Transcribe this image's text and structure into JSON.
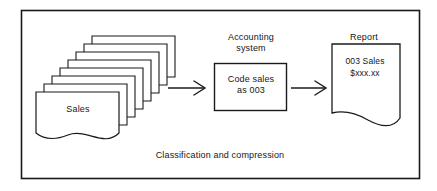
{
  "diagram": {
    "title": "Classification and compression",
    "caption": "Classification and compression",
    "border_color": "#1a1a1a",
    "line_color": "#1a1a1a",
    "background_color": "#ffffff",
    "input": {
      "name": "sales-document-stack",
      "label": "Sales",
      "sheet_count": 8
    },
    "process": {
      "name": "accounting-system",
      "heading_line_1": "Accounting",
      "heading_line_2": "system",
      "body_line_1": "Code sales",
      "body_line_2": "as 003"
    },
    "output": {
      "name": "report-document",
      "heading": "Report",
      "body_line_1": "003 Sales",
      "body_line_2": "$xxx.xx"
    },
    "arrows": [
      {
        "name": "arrow-sales-to-accounting",
        "from": "sales-document-stack",
        "to": "accounting-system"
      },
      {
        "name": "arrow-accounting-to-report",
        "from": "accounting-system",
        "to": "report-document"
      }
    ]
  }
}
